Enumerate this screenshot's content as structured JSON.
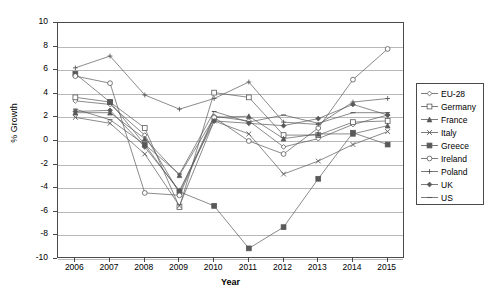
{
  "chart_data": {
    "type": "line",
    "title": "",
    "xlabel": "Year",
    "ylabel": "% Growth",
    "categories": [
      2006,
      2007,
      2008,
      2009,
      2010,
      2011,
      2012,
      2013,
      2014,
      2015
    ],
    "xtick_labels": [
      "2006",
      "2007",
      "2008",
      "2009",
      "2010",
      "2011",
      "2012",
      "2013",
      "2014",
      "2015"
    ],
    "ytick_labels": [
      "10",
      "8",
      "6",
      "4",
      "2",
      "0",
      "-2",
      "-4",
      "-6",
      "-8",
      "-10"
    ],
    "ylim": [
      -10,
      10
    ],
    "ytick_step": 2,
    "grid": true,
    "legend_position": "right",
    "series": [
      {
        "name": "EU-28",
        "marker": "diamond",
        "values": [
          3.4,
          3.1,
          0.5,
          -4.4,
          2.1,
          1.7,
          -0.5,
          0.2,
          1.4,
          2.2
        ]
      },
      {
        "name": "Germany",
        "marker": "square",
        "values": [
          3.7,
          3.3,
          1.1,
          -5.6,
          4.1,
          3.7,
          0.5,
          0.5,
          1.6,
          1.7
        ]
      },
      {
        "name": "France",
        "marker": "triangle",
        "values": [
          2.4,
          2.4,
          0.2,
          -2.9,
          2.0,
          2.1,
          0.2,
          0.6,
          0.6,
          1.3
        ]
      },
      {
        "name": "Italy",
        "marker": "cross-x",
        "values": [
          2.0,
          1.5,
          -1.1,
          -5.5,
          1.7,
          0.6,
          -2.8,
          -1.7,
          -0.3,
          0.8
        ]
      },
      {
        "name": "Greece",
        "marker": "filled-square",
        "values": [
          5.7,
          3.3,
          -0.3,
          -4.3,
          -5.5,
          -9.1,
          -7.3,
          -3.2,
          0.7,
          -0.3
        ]
      },
      {
        "name": "Ireland",
        "marker": "circle",
        "values": [
          5.5,
          4.9,
          -4.4,
          -4.6,
          2.0,
          0.0,
          -1.1,
          1.1,
          5.2,
          7.8
        ]
      },
      {
        "name": "Poland",
        "marker": "plus",
        "values": [
          6.2,
          7.2,
          3.9,
          2.7,
          3.6,
          5.0,
          1.6,
          1.4,
          3.3,
          3.6
        ]
      },
      {
        "name": "UK",
        "marker": "filled-diamond",
        "values": [
          2.5,
          2.6,
          -0.5,
          -4.2,
          1.7,
          1.5,
          1.3,
          1.9,
          3.1,
          2.2
        ]
      },
      {
        "name": "US",
        "marker": "dash",
        "values": [
          2.7,
          1.8,
          -0.3,
          -2.8,
          2.5,
          1.6,
          2.2,
          1.5,
          2.4,
          2.4
        ]
      }
    ],
    "series_color": "#595959"
  }
}
